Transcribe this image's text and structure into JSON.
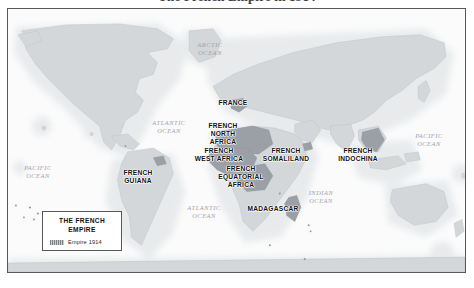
{
  "document": {
    "title_fragment": "The French Empire in 1914",
    "map_title": "THE FRENCH EMPIRE"
  },
  "map": {
    "frame": {
      "border_color": "#55595c",
      "background": "#fbfbfb"
    },
    "colors": {
      "ocean": "#fbfbfb",
      "land": "#d2d6d9",
      "land_outline": "#b9bec2",
      "empire_fill": "#9aa0a5",
      "sea_halo": "#eceef0",
      "label_text": "#111111",
      "ocean_label_text": "#9ba2a8"
    },
    "ocean_labels": [
      {
        "name": "arctic-ocean",
        "text": "ARCTIC\nOCEAN",
        "x": 209,
        "y": 48
      },
      {
        "name": "atlantic-ocean-north",
        "text": "ATLANTIC\nOCEAN",
        "x": 168,
        "y": 126
      },
      {
        "name": "atlantic-ocean-south",
        "text": "ATLANTIC\nOCEAN",
        "x": 203,
        "y": 211
      },
      {
        "name": "pacific-ocean-west",
        "text": "PACIFIC\nOCEAN",
        "x": 37,
        "y": 171
      },
      {
        "name": "pacific-ocean-east",
        "text": "PACIFIC\nOCEAN",
        "x": 428,
        "y": 139
      },
      {
        "name": "indian-ocean",
        "text": "INDIAN\nOCEAN",
        "x": 320,
        "y": 196
      }
    ],
    "place_labels": [
      {
        "name": "france",
        "text": "FRANCE",
        "x": 232,
        "y": 102
      },
      {
        "name": "french-north-africa",
        "text": "FRENCH\nNORTH\nAFRICA",
        "x": 222,
        "y": 133
      },
      {
        "name": "french-west-africa",
        "text": "FRENCH\nWEST AFRICA",
        "x": 218,
        "y": 154
      },
      {
        "name": "french-somaliland",
        "text": "FRENCH\nSOMALILAND",
        "x": 285,
        "y": 154
      },
      {
        "name": "french-equatorial-africa",
        "text": "FRENCH\nEQUATORIAL\nAFRICA",
        "x": 240,
        "y": 176
      },
      {
        "name": "french-indochina",
        "text": "FRENCH\nINDOCHINA",
        "x": 357,
        "y": 154
      },
      {
        "name": "french-guiana",
        "text": "FRENCH\nGUIANA",
        "x": 137,
        "y": 176
      },
      {
        "name": "madagascar",
        "text": "MADAGASCAR",
        "x": 272,
        "y": 208
      }
    ]
  },
  "legend": {
    "title": "THE FRENCH\nEMPIRE",
    "entries": [
      {
        "name": "empire-1914",
        "label": "Empire 1914",
        "swatch": "hatched-gray"
      }
    ]
  }
}
